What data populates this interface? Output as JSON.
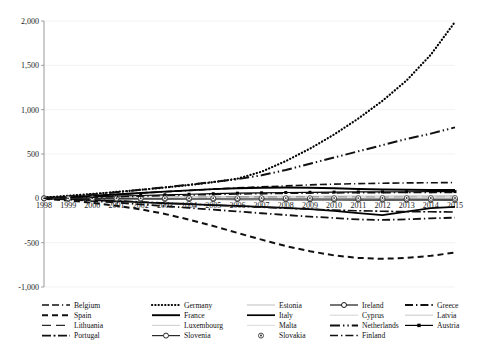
{
  "chart_data": {
    "type": "line",
    "title": "",
    "subtitle": "",
    "xlabel": "",
    "ylabel": "",
    "grid": true,
    "grid_axis": "y",
    "legend_position": "bottom",
    "legend_columns": 5,
    "xlim": [
      1998,
      2015
    ],
    "ylim": [
      -1000,
      2000
    ],
    "ytick_values": [
      2000,
      1500,
      1000,
      500,
      0,
      -500,
      -1000
    ],
    "ytick_labels": [
      "2,000",
      "1,500",
      "1,000",
      "500",
      "0",
      "-500",
      "-1,000"
    ],
    "x": [
      1998,
      1999,
      2000,
      2001,
      2002,
      2003,
      2004,
      2005,
      2006,
      2007,
      2008,
      2009,
      2010,
      2011,
      2012,
      2013,
      2014,
      2015
    ],
    "xtick_labels": [
      "1998",
      "1999",
      "2000",
      "2001",
      "2002",
      "2003",
      "2004",
      "2005",
      "2006",
      "2007",
      "2008",
      "2009",
      "2010",
      "2011",
      "2012",
      "2013",
      "2014",
      "2015"
    ],
    "series": [
      {
        "name": "Belgium",
        "style": "dash-dash-dot",
        "color": "#111111",
        "width": 1.6,
        "marker": "none",
        "values": [
          4,
          16,
          30,
          44,
          60,
          74,
          88,
          104,
          118,
          130,
          140,
          152,
          160,
          166,
          170,
          174,
          176,
          178
        ]
      },
      {
        "name": "Germany",
        "style": "dotted",
        "color": "#000000",
        "width": 2.2,
        "marker": "none",
        "values": [
          10,
          28,
          50,
          72,
          96,
          122,
          150,
          182,
          222,
          300,
          420,
          560,
          720,
          900,
          1100,
          1330,
          1620,
          1990
        ]
      },
      {
        "name": "Estonia",
        "style": "solid",
        "color": "#c8c8c8",
        "width": 1.1,
        "marker": "none",
        "values": [
          1,
          3,
          6,
          9,
          12,
          15,
          17,
          19,
          21,
          22,
          23,
          24,
          25,
          26,
          27,
          28,
          29,
          30
        ]
      },
      {
        "name": "Ireland",
        "style": "solid-marker",
        "color": "#1a1a1a",
        "width": 1.1,
        "marker": "circle-open",
        "values": [
          -2,
          -4,
          -6,
          -8,
          -10,
          -12,
          -13,
          -14,
          -15,
          -16,
          -17,
          -18,
          -19,
          -20,
          -20,
          -21,
          -22,
          -23
        ]
      },
      {
        "name": "Greece",
        "style": "dash-dot",
        "color": "#111111",
        "width": 1.8,
        "marker": "none",
        "values": [
          -3,
          -14,
          -30,
          -48,
          -68,
          -88,
          -108,
          -128,
          -148,
          -168,
          -188,
          -206,
          -222,
          -238,
          -244,
          -236,
          -226,
          -218
        ]
      },
      {
        "name": "Spain",
        "style": "dashed",
        "color": "#111111",
        "width": 2.0,
        "marker": "none",
        "values": [
          -6,
          -24,
          -50,
          -84,
          -124,
          -176,
          -240,
          -312,
          -390,
          -466,
          -538,
          -596,
          -644,
          -672,
          -682,
          -672,
          -648,
          -612
        ]
      },
      {
        "name": "France",
        "style": "solid",
        "color": "#000000",
        "width": 1.9,
        "marker": "none",
        "values": [
          3,
          14,
          28,
          44,
          60,
          76,
          90,
          104,
          114,
          120,
          122,
          120,
          114,
          106,
          100,
          96,
          94,
          94
        ]
      },
      {
        "name": "Italy",
        "style": "solid-thick",
        "color": "#000000",
        "width": 1.7,
        "marker": "none",
        "values": [
          -2,
          -10,
          -20,
          -32,
          -44,
          -56,
          -66,
          -76,
          -86,
          -96,
          -108,
          -122,
          -142,
          -166,
          -190,
          -150,
          -110,
          -96
        ]
      },
      {
        "name": "Cyprus",
        "style": "solid-faint",
        "color": "#dadada",
        "width": 1.0,
        "marker": "none",
        "values": [
          0,
          1,
          2,
          3,
          4,
          5,
          5,
          6,
          6,
          7,
          7,
          7,
          8,
          8,
          8,
          8,
          9,
          9
        ]
      },
      {
        "name": "Latvia",
        "style": "solid-faint",
        "color": "#cfcfcf",
        "width": 1.0,
        "marker": "none",
        "values": [
          -1,
          -2,
          -4,
          -5,
          -7,
          -8,
          -9,
          -10,
          -11,
          -12,
          -12,
          -13,
          -13,
          -14,
          -14,
          -15,
          -15,
          -16
        ]
      },
      {
        "name": "Lithuania",
        "style": "long-dash",
        "color": "#2a2a2a",
        "width": 1.2,
        "marker": "none",
        "values": [
          1,
          2,
          4,
          6,
          8,
          9,
          11,
          12,
          13,
          14,
          15,
          16,
          16,
          17,
          17,
          18,
          18,
          19
        ]
      },
      {
        "name": "Luxembourg",
        "style": "solid-faint",
        "color": "#d5d5d5",
        "width": 1.0,
        "marker": "none",
        "values": [
          0,
          2,
          4,
          6,
          8,
          10,
          12,
          13,
          14,
          15,
          16,
          16,
          17,
          17,
          18,
          18,
          19,
          19
        ]
      },
      {
        "name": "Malta",
        "style": "solid-faint",
        "color": "#e0e0e0",
        "width": 1.0,
        "marker": "none",
        "values": [
          0,
          0,
          1,
          1,
          2,
          2,
          2,
          3,
          3,
          3,
          3,
          4,
          4,
          4,
          4,
          4,
          5,
          5
        ]
      },
      {
        "name": "Netherlands",
        "style": "dash-dot-dot",
        "color": "#111111",
        "width": 2.0,
        "marker": "none",
        "values": [
          6,
          22,
          44,
          68,
          96,
          124,
          154,
          184,
          216,
          260,
          320,
          390,
          460,
          530,
          600,
          670,
          730,
          800
        ]
      },
      {
        "name": "Austria",
        "style": "solid-marker",
        "color": "#000000",
        "width": 1.2,
        "marker": "square-filled",
        "values": [
          2,
          8,
          16,
          24,
          32,
          40,
          46,
          52,
          58,
          62,
          66,
          68,
          70,
          72,
          73,
          74,
          75,
          76
        ]
      },
      {
        "name": "Portugal",
        "style": "dash-dot-thick",
        "color": "#111111",
        "width": 1.6,
        "marker": "none",
        "values": [
          -2,
          -8,
          -18,
          -28,
          -40,
          -52,
          -64,
          -76,
          -88,
          -100,
          -112,
          -122,
          -132,
          -140,
          -146,
          -150,
          -152,
          -154
        ]
      },
      {
        "name": "Slovenia",
        "style": "solid-marker",
        "color": "#2a2a2a",
        "width": 1.0,
        "marker": "circle-open-large",
        "values": [
          0,
          -1,
          -2,
          -3,
          -4,
          -5,
          -6,
          -6,
          -7,
          -7,
          -8,
          -8,
          -9,
          -9,
          -10,
          -10,
          -11,
          -11
        ]
      },
      {
        "name": "Slovakia",
        "style": "marker-only",
        "color": "#333333",
        "width": 0,
        "marker": "circle-dot",
        "values": [
          0,
          0,
          1,
          1,
          1,
          2,
          2,
          2,
          2,
          3,
          3,
          3,
          3,
          3,
          4,
          4,
          4,
          4
        ]
      },
      {
        "name": "Finland",
        "style": "dash-dot",
        "color": "#111111",
        "width": 1.5,
        "marker": "none",
        "values": [
          1,
          5,
          11,
          17,
          24,
          31,
          37,
          43,
          48,
          52,
          56,
          59,
          61,
          63,
          64,
          65,
          66,
          67
        ]
      }
    ]
  },
  "legend": {
    "columns": [
      {
        "items": [
          "Belgium",
          "Spain",
          "Lithuania",
          "Portugal"
        ]
      },
      {
        "items": [
          "Germany",
          "France",
          "Luxembourg",
          "Slovenia"
        ]
      },
      {
        "items": [
          "Estonia",
          "Italy",
          "Malta",
          "Slovakia"
        ]
      },
      {
        "items": [
          "Ireland",
          "Cyprus",
          "Netherlands",
          "Finland"
        ]
      },
      {
        "items": [
          "Greece",
          "Latvia",
          "Austria"
        ]
      }
    ]
  }
}
